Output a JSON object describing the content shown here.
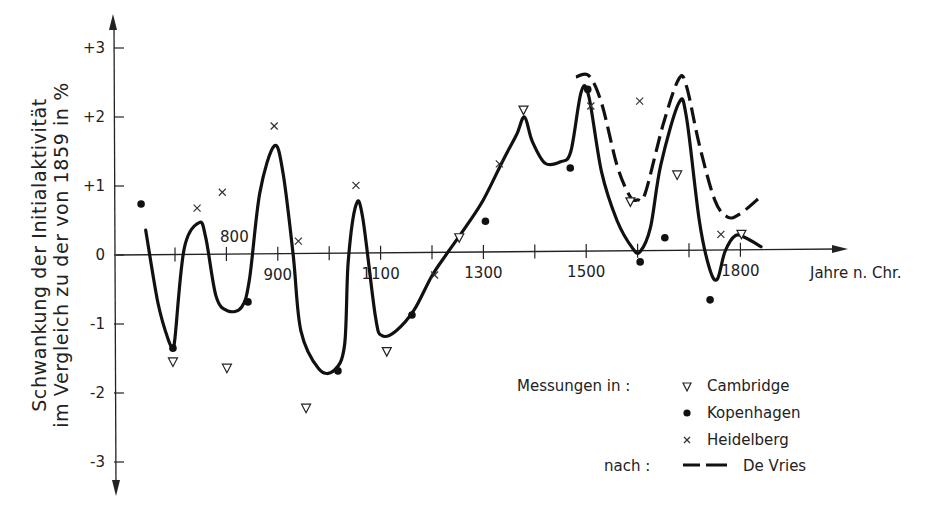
{
  "chart_data": {
    "type": "line",
    "title": "",
    "xlabel": "Jahre n. Chr.",
    "ylabel_line1": "Schwankung der Initialaktivität",
    "ylabel_line2": "im Vergleich zu der von 1859 in %",
    "ylabel": "Schwankung der Initialaktivität im Vergleich zu der von 1859 in %",
    "xlim": [
      650,
      1950
    ],
    "ylim": [
      -3.5,
      3.5
    ],
    "grid": false,
    "x_ticks": [
      700,
      800,
      900,
      1000,
      1100,
      1200,
      1300,
      1400,
      1500,
      1600,
      1700,
      1800
    ],
    "x_tick_labels": [
      {
        "year": 800,
        "label": "800",
        "position": "above"
      },
      {
        "year": 900,
        "label": "900",
        "position": "below"
      },
      {
        "year": 1100,
        "label": "1100",
        "position": "below"
      },
      {
        "year": 1300,
        "label": "1300",
        "position": "below"
      },
      {
        "year": 1500,
        "label": "1500",
        "position": "below"
      },
      {
        "year": 1800,
        "label": "1800",
        "position": "below"
      }
    ],
    "y_ticks": [
      3,
      2,
      1,
      0,
      -1,
      -2,
      -3
    ],
    "y_tick_labels": [
      "+3",
      "+2",
      "+1",
      "0",
      "-1",
      "-2",
      "-3"
    ],
    "series": [
      {
        "name": "Cambridge",
        "kind": "scatter",
        "marker": "triangle-down",
        "points": [
          [
            696,
            -1.55
          ],
          [
            801,
            -1.64
          ],
          [
            955,
            -2.22
          ],
          [
            1112,
            -1.4
          ],
          [
            1253,
            0.25
          ],
          [
            1378,
            2.1
          ],
          [
            1586,
            0.77
          ],
          [
            1677,
            1.16
          ],
          [
            1802,
            0.3
          ]
        ]
      },
      {
        "name": "Kopenhagen",
        "kind": "scatter",
        "marker": "dot",
        "points": [
          [
            634,
            0.74
          ],
          [
            696,
            -1.35
          ],
          [
            842,
            -0.68
          ],
          [
            1017,
            -1.68
          ],
          [
            1161,
            -0.87
          ],
          [
            1304,
            0.49
          ],
          [
            1469,
            1.26
          ],
          [
            1503,
            2.4
          ],
          [
            1605,
            -0.1
          ],
          [
            1653,
            0.25
          ],
          [
            1741,
            -0.65
          ]
        ]
      },
      {
        "name": "Heidelberg",
        "kind": "scatter",
        "marker": "x",
        "points": [
          [
            743,
            0.68
          ],
          [
            792,
            0.91
          ],
          [
            893,
            1.87
          ],
          [
            940,
            0.2
          ],
          [
            1052,
            1.01
          ],
          [
            1205,
            -0.29
          ],
          [
            1331,
            1.32
          ],
          [
            1509,
            2.16
          ],
          [
            1604,
            2.23
          ],
          [
            1762,
            0.3
          ]
        ]
      },
      {
        "name": "Messkurve",
        "kind": "line",
        "style": "solid",
        "points": [
          [
            643,
            0.36
          ],
          [
            667,
            -0.7
          ],
          [
            688,
            -1.25
          ],
          [
            696,
            -1.32
          ],
          [
            700,
            -1.2
          ],
          [
            718,
            0.1
          ],
          [
            747,
            0.47
          ],
          [
            760,
            0.25
          ],
          [
            780,
            -0.6
          ],
          [
            803,
            -0.81
          ],
          [
            830,
            -0.75
          ],
          [
            845,
            -0.35
          ],
          [
            865,
            0.9
          ],
          [
            893,
            1.58
          ],
          [
            910,
            1.2
          ],
          [
            930,
            0
          ],
          [
            945,
            -1.1
          ],
          [
            980,
            -1.65
          ],
          [
            1010,
            -1.67
          ],
          [
            1030,
            -1.3
          ],
          [
            1037,
            -0.1
          ],
          [
            1052,
            0.72
          ],
          [
            1065,
            0.55
          ],
          [
            1090,
            -0.9
          ],
          [
            1103,
            -1.17
          ],
          [
            1130,
            -1.1
          ],
          [
            1165,
            -0.8
          ],
          [
            1200,
            -0.3
          ],
          [
            1230,
            0.03
          ],
          [
            1265,
            0.4
          ],
          [
            1300,
            0.8
          ],
          [
            1340,
            1.4
          ],
          [
            1365,
            1.75
          ],
          [
            1380,
            2.0
          ],
          [
            1395,
            1.65
          ],
          [
            1420,
            1.33
          ],
          [
            1450,
            1.35
          ],
          [
            1470,
            1.5
          ],
          [
            1490,
            2.36
          ],
          [
            1505,
            2.3
          ],
          [
            1530,
            1.2
          ],
          [
            1560,
            0.5
          ],
          [
            1590,
            0.1
          ],
          [
            1605,
            0.05
          ],
          [
            1625,
            0.4
          ],
          [
            1645,
            1.3
          ],
          [
            1680,
            2.2
          ],
          [
            1695,
            2.0
          ],
          [
            1720,
            0.5
          ],
          [
            1740,
            -0.2
          ],
          [
            1755,
            -0.35
          ],
          [
            1770,
            0.05
          ],
          [
            1790,
            0.28
          ],
          [
            1810,
            0.25
          ],
          [
            1840,
            0.12
          ]
        ]
      },
      {
        "name": "De Vries",
        "kind": "line",
        "style": "dashed",
        "points": [
          [
            1480,
            2.58
          ],
          [
            1505,
            2.6
          ],
          [
            1530,
            2.2
          ],
          [
            1560,
            1.3
          ],
          [
            1585,
            0.85
          ],
          [
            1600,
            0.8
          ],
          [
            1615,
            0.9
          ],
          [
            1650,
            1.9
          ],
          [
            1680,
            2.55
          ],
          [
            1695,
            2.45
          ],
          [
            1720,
            1.6
          ],
          [
            1750,
            0.8
          ],
          [
            1775,
            0.55
          ],
          [
            1800,
            0.6
          ],
          [
            1840,
            0.85
          ]
        ]
      }
    ],
    "legend": {
      "position": "lower-right",
      "measurements_label": "Messungen in :",
      "entries": [
        {
          "marker": "triangle-down",
          "label": "Cambridge"
        },
        {
          "marker": "dot",
          "label": "Kopenhagen"
        },
        {
          "marker": "x",
          "label": "Heidelberg"
        }
      ],
      "source_label": "nach :",
      "source_entry": {
        "marker": "dashed-line",
        "label": "De Vries"
      }
    }
  }
}
